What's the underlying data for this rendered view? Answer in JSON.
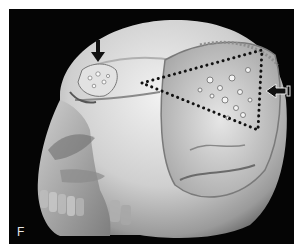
{
  "figure": {
    "panel_label": "F",
    "background_color": "#050505",
    "bone_color": "#d8d8d8",
    "annotations": {
      "down_arrow": {
        "color": "#111111",
        "points_to": "frontal bone lesion"
      },
      "left_arrow": {
        "style": "outlined-white",
        "points_to": "parietal defect margin"
      },
      "dotted_triangle": {
        "color": "#111111",
        "vertices": [
          [
            142,
            83
          ],
          [
            262,
            50
          ],
          [
            258,
            130
          ]
        ]
      }
    }
  }
}
